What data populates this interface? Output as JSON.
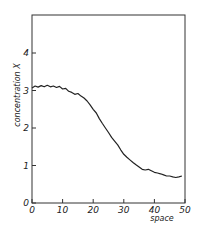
{
  "chart_data": {
    "type": "line",
    "title": "",
    "xlabel": "space",
    "ylabel": "concentration X",
    "xlim": [
      0,
      50
    ],
    "ylim": [
      0,
      5
    ],
    "grid": false,
    "legend": null,
    "x_ticks": [
      "0",
      "10",
      "20",
      "30",
      "40",
      "50"
    ],
    "y_ticks": [
      "0",
      "1",
      "2",
      "3",
      "4"
    ],
    "series": [
      {
        "name": "concentration",
        "x": [
          0,
          1,
          2,
          3,
          4,
          5,
          6,
          7,
          8,
          9,
          10,
          11,
          12,
          13,
          14,
          15,
          16,
          17,
          18,
          19,
          20,
          21,
          22,
          23,
          24,
          25,
          26,
          27,
          28,
          29,
          30,
          31,
          32,
          33,
          34,
          35,
          36,
          37,
          38,
          39,
          40,
          41,
          42,
          43,
          44,
          45,
          46,
          47,
          48,
          49
        ],
        "values": [
          3.07,
          3.12,
          3.09,
          3.13,
          3.1,
          3.14,
          3.1,
          3.12,
          3.08,
          3.11,
          3.04,
          3.06,
          2.98,
          2.95,
          2.9,
          2.92,
          2.85,
          2.8,
          2.72,
          2.62,
          2.5,
          2.4,
          2.25,
          2.12,
          2.0,
          1.88,
          1.75,
          1.65,
          1.55,
          1.42,
          1.3,
          1.22,
          1.15,
          1.08,
          1.02,
          0.96,
          0.9,
          0.88,
          0.9,
          0.86,
          0.82,
          0.8,
          0.78,
          0.75,
          0.72,
          0.72,
          0.7,
          0.68,
          0.7,
          0.72
        ]
      }
    ]
  },
  "labels": {
    "xlabel": "space",
    "ylabel": "concentration X",
    "x_ticks": [
      "0",
      "10",
      "20",
      "30",
      "40",
      "50"
    ],
    "y_ticks": [
      "0",
      "1",
      "2",
      "3",
      "4"
    ]
  }
}
